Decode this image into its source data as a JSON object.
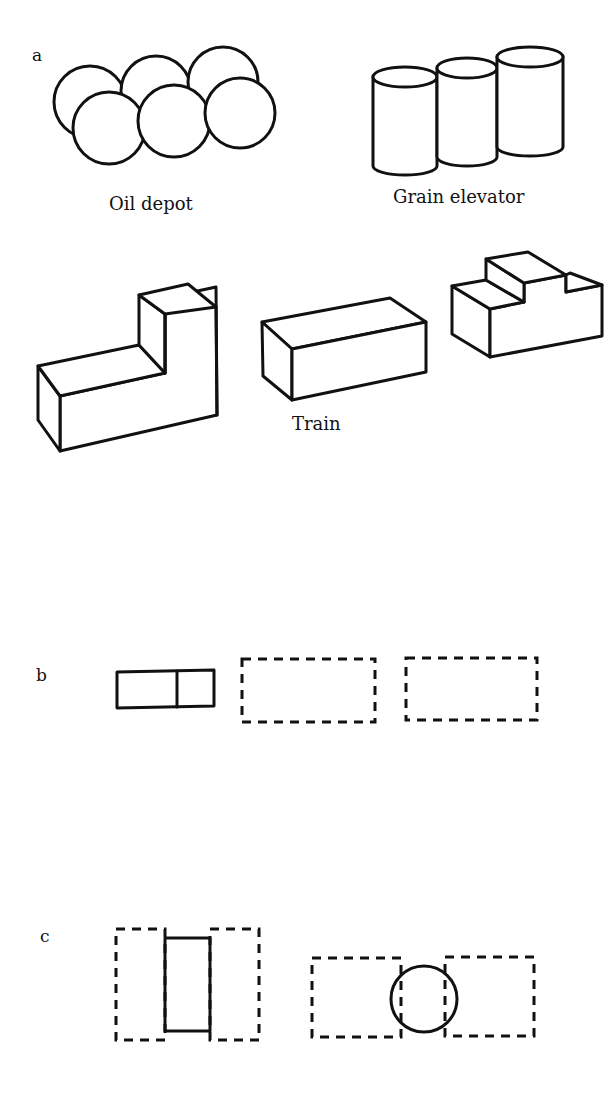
{
  "figure": {
    "panels": [
      {
        "id": "a",
        "label": "a",
        "objects": [
          {
            "name": "Oil depot",
            "label": "Oil depot",
            "shape": "six overlapping circles (two rows of three)"
          },
          {
            "name": "Grain elevator",
            "label": "Grain elevator",
            "shape": "three adjacent cylinders"
          },
          {
            "name": "L-block",
            "label": "",
            "shape": "L-shaped 3D block"
          },
          {
            "name": "Train",
            "label": "Train",
            "shape": "rectangular box"
          },
          {
            "name": "stepped-block",
            "label": "",
            "shape": "3D block with step and notch"
          }
        ]
      },
      {
        "id": "b",
        "label": "b",
        "objects": [
          {
            "name": "solid-divided-rectangle",
            "style": "solid",
            "shape": "rectangle split by vertical line"
          },
          {
            "name": "dashed-rectangle-1",
            "style": "dashed",
            "shape": "rectangle"
          },
          {
            "name": "dashed-rectangle-2",
            "style": "dashed",
            "shape": "rectangle"
          }
        ]
      },
      {
        "id": "c",
        "label": "c",
        "objects": [
          {
            "name": "rectangle-between-dashed",
            "style": "solid + dashed",
            "shape": "solid rectangle between two dashed rectangles"
          },
          {
            "name": "circle-between-dashed",
            "style": "solid + dashed",
            "shape": "solid circle overlapping two dashed rectangles"
          }
        ]
      }
    ]
  },
  "labels": {
    "panel_a": "a",
    "panel_b": "b",
    "panel_c": "c",
    "oil_depot": "Oil depot",
    "grain_elevator": "Grain elevator",
    "train": "Train"
  },
  "colors": {
    "ink": "#111111",
    "background": "#ffffff"
  }
}
